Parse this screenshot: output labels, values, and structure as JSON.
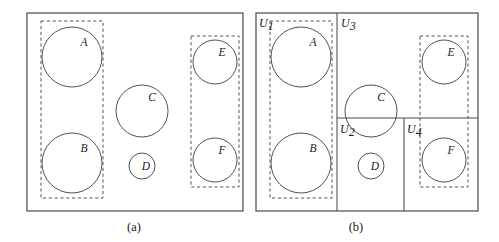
{
  "figure": {
    "title": "",
    "panels": [
      {
        "id": "a",
        "caption": "(a)",
        "caption_x": 134,
        "caption_y": 231,
        "frame": {
          "x": 27,
          "y": 13,
          "w": 216,
          "h": 198
        },
        "dashed_groups": [
          {
            "name": "group-left",
            "x": 41,
            "y": 21,
            "w": 62,
            "h": 177
          },
          {
            "name": "group-right",
            "x": 191,
            "y": 36,
            "w": 48,
            "h": 151
          }
        ],
        "circles": [
          {
            "label": "A",
            "cx": 72,
            "cy": 57,
            "r": 30,
            "lx": 84,
            "ly": 46
          },
          {
            "label": "B",
            "cx": 72,
            "cy": 163,
            "r": 30,
            "lx": 84,
            "ly": 152
          },
          {
            "label": "C",
            "cx": 142,
            "cy": 111,
            "r": 26,
            "lx": 152,
            "ly": 101
          },
          {
            "label": "D",
            "cx": 142,
            "cy": 166,
            "r": 13,
            "lx": 146,
            "ly": 170
          },
          {
            "label": "E",
            "cx": 215,
            "cy": 62,
            "r": 22,
            "lx": 222,
            "ly": 56
          },
          {
            "label": "F",
            "cx": 215,
            "cy": 160,
            "r": 22,
            "lx": 222,
            "ly": 154
          }
        ],
        "dividers": []
      },
      {
        "id": "b",
        "caption": "(b)",
        "caption_x": 356,
        "caption_y": 231,
        "frame": {
          "x": 256,
          "y": 13,
          "w": 222,
          "h": 198
        },
        "dashed_groups": [
          {
            "name": "group-left",
            "x": 270,
            "y": 21,
            "w": 62,
            "h": 177
          },
          {
            "name": "group-right",
            "x": 420,
            "y": 36,
            "w": 48,
            "h": 151
          }
        ],
        "circles": [
          {
            "label": "A",
            "cx": 301,
            "cy": 57,
            "r": 30,
            "lx": 313,
            "ly": 46
          },
          {
            "label": "B",
            "cx": 301,
            "cy": 163,
            "r": 30,
            "lx": 313,
            "ly": 152
          },
          {
            "label": "C",
            "cx": 371,
            "cy": 111,
            "r": 26,
            "lx": 381,
            "ly": 101
          },
          {
            "label": "D",
            "cx": 371,
            "cy": 166,
            "r": 13,
            "lx": 375,
            "ly": 170
          },
          {
            "label": "E",
            "cx": 444,
            "cy": 62,
            "r": 22,
            "lx": 451,
            "ly": 56
          },
          {
            "label": "F",
            "cx": 444,
            "cy": 160,
            "r": 22,
            "lx": 451,
            "ly": 154
          }
        ],
        "dividers": [
          {
            "name": "vertical-divider-left",
            "x1": 337,
            "y1": 13,
            "x2": 337,
            "y2": 211
          },
          {
            "name": "horizontal-divider",
            "x1": 337,
            "y1": 118,
            "x2": 478,
            "y2": 118
          },
          {
            "name": "vertical-divider-right",
            "x1": 404,
            "y1": 118,
            "x2": 404,
            "y2": 211
          }
        ],
        "partition_labels": [
          {
            "base": "U",
            "sub": "1",
            "x": 259,
            "y": 27
          },
          {
            "base": "U",
            "sub": "2",
            "x": 340,
            "y": 133
          },
          {
            "base": "U",
            "sub": "3",
            "x": 341,
            "y": 27
          },
          {
            "base": "U",
            "sub": "4",
            "x": 407,
            "y": 133
          }
        ]
      }
    ]
  },
  "colors": {
    "frame_stroke": "#4a4a4a",
    "dashed_stroke": "#555555",
    "circle_stroke": "#3d3d3d",
    "text": "#1a1a1a",
    "background": "#ffffff"
  }
}
